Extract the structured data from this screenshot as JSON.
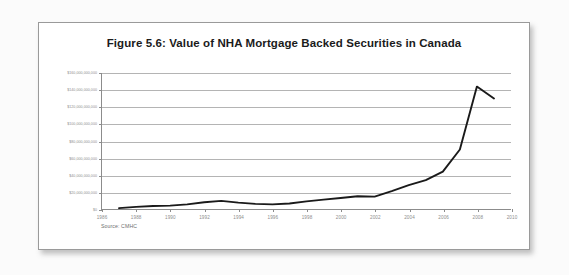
{
  "figure": {
    "title": "Figure 5.6: Value of NHA Mortgage Backed Securities in Canada",
    "source_note": "Source: CMHC"
  },
  "chart_data": {
    "type": "line",
    "title": "Figure 5.6: Value of NHA Mortgage Backed Securities in Canada",
    "subtitle": "",
    "xlabel": "",
    "ylabel": "",
    "xlim": [
      1986,
      2010
    ],
    "ylim": [
      0,
      160000000000
    ],
    "grid": true,
    "legend": "none",
    "annotations": [
      "Source: CMHC"
    ],
    "x_tick_labels": [
      "1986",
      "1988",
      "1990",
      "1992",
      "1994",
      "1996",
      "1998",
      "2000",
      "2002",
      "2004",
      "2006",
      "2008",
      "2010"
    ],
    "x_ticks": [
      1986,
      1988,
      1990,
      1992,
      1994,
      1996,
      1998,
      2000,
      2002,
      2004,
      2006,
      2008,
      2010
    ],
    "y_tick_labels": [
      "$0",
      "$20,000,000,000",
      "$40,000,000,000",
      "$60,000,000,000",
      "$80,000,000,000",
      "$100,000,000,000",
      "$120,000,000,000",
      "$140,000,000,000",
      "$160,000,000,000"
    ],
    "y_ticks": [
      0,
      20000000000,
      40000000000,
      60000000000,
      80000000000,
      100000000000,
      120000000000,
      140000000000,
      160000000000
    ],
    "series": [
      {
        "name": "Value of NHA Mortgage Backed Securities",
        "color": "#1a1a1a",
        "x": [
          1987,
          1988,
          1989,
          1990,
          1991,
          1992,
          1993,
          1994,
          1995,
          1996,
          1997,
          1998,
          1999,
          2000,
          2001,
          2002,
          2003,
          2004,
          2005,
          2006,
          2007,
          2008,
          2009
        ],
        "values": [
          1000000000,
          2500000000,
          3500000000,
          4000000000,
          5500000000,
          8000000000,
          9500000000,
          7500000000,
          6000000000,
          5500000000,
          6500000000,
          9000000000,
          11000000000,
          13000000000,
          15000000000,
          14500000000,
          21000000000,
          28000000000,
          34000000000,
          44000000000,
          70000000000,
          144000000000,
          130000000000
        ]
      }
    ]
  }
}
